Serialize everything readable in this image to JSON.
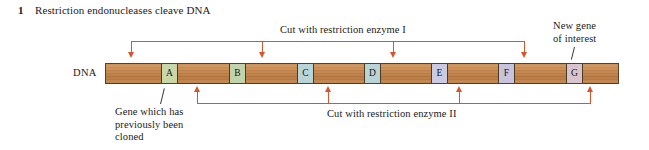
{
  "figure": {
    "step_number": "1",
    "title": "Restriction endonucleases cleave DNA"
  },
  "dna": {
    "label": "DNA",
    "bar_color": "#c98a52",
    "border_color": "#55411f",
    "genes": [
      {
        "label": "A",
        "color": "#c9d7a8",
        "left": 55
      },
      {
        "label": "B",
        "color": "#c2d3ab",
        "left": 123
      },
      {
        "label": "C",
        "color": "#b9d4d6",
        "left": 191
      },
      {
        "label": "D",
        "color": "#b9d4d6",
        "left": 258
      },
      {
        "label": "E",
        "color": "#cacbe2",
        "left": 325
      },
      {
        "label": "F",
        "color": "#c8c3dc",
        "left": 392
      },
      {
        "label": "G",
        "color": "#d9c3cc",
        "left": 460
      }
    ]
  },
  "cuts": {
    "accent_color": "#d8542c",
    "enzyme_one": {
      "label": "Cut with restriction enzyme I",
      "arrow_positions": [
        131,
        262,
        393,
        524
      ]
    },
    "enzyme_two": {
      "label": "Cut with restriction enzyme II",
      "arrow_positions": [
        197,
        328,
        459,
        590
      ]
    }
  },
  "callouts": {
    "cloned_gene": "Gene which has\npreviously been\ncloned",
    "new_gene": "New gene\nof interest"
  }
}
